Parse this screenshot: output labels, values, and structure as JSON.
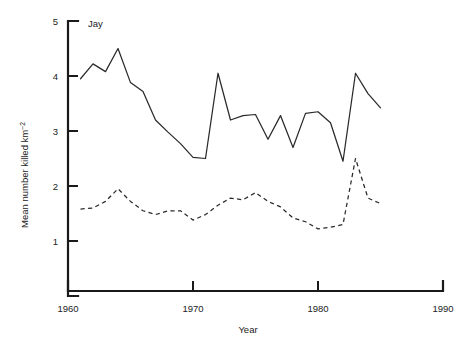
{
  "chart_data": {
    "type": "line",
    "title": "Jay",
    "xlabel": "Year",
    "ylabel": "Mean number killed km",
    "ylabel_exponent": "−2",
    "xlim": [
      1960,
      1990
    ],
    "ylim": [
      0,
      5
    ],
    "xticks": [
      1960,
      1970,
      1980,
      1990
    ],
    "xtick_labels": [
      "1960",
      "1970",
      "1980",
      "1990"
    ],
    "yticks": [
      1,
      2,
      3,
      4,
      5
    ],
    "ytick_labels": [
      "1",
      "2",
      "3",
      "4",
      "5"
    ],
    "grid": false,
    "legend_position": "none",
    "annotations": [
      {
        "text": "Jay",
        "x": 1961.2,
        "y": 4.85
      }
    ],
    "series": [
      {
        "name": "solid-series",
        "style": "solid",
        "x": [
          1961,
          1962,
          1963,
          1964,
          1965,
          1966,
          1967,
          1968,
          1969,
          1970,
          1971,
          1972,
          1973,
          1974,
          1975,
          1976,
          1977,
          1978,
          1979,
          1980,
          1981,
          1982,
          1983,
          1984,
          1985
        ],
        "values": [
          3.95,
          4.22,
          4.08,
          4.5,
          3.88,
          3.72,
          3.2,
          2.98,
          2.77,
          2.52,
          2.5,
          4.05,
          3.2,
          3.28,
          3.3,
          2.85,
          3.28,
          2.7,
          3.32,
          3.35,
          3.15,
          2.45,
          4.05,
          3.68,
          3.42
        ]
      },
      {
        "name": "dashed-series",
        "style": "dashed",
        "x": [
          1961,
          1962,
          1963,
          1964,
          1965,
          1966,
          1967,
          1968,
          1969,
          1970,
          1971,
          1972,
          1973,
          1974,
          1975,
          1976,
          1977,
          1978,
          1979,
          1980,
          1981,
          1982,
          1983,
          1984,
          1985
        ],
        "values": [
          1.58,
          1.6,
          1.72,
          1.95,
          1.72,
          1.55,
          1.48,
          1.55,
          1.55,
          1.38,
          1.48,
          1.65,
          1.78,
          1.75,
          1.88,
          1.72,
          1.62,
          1.42,
          1.35,
          1.22,
          1.25,
          1.3,
          2.5,
          1.78,
          1.68
        ]
      }
    ]
  },
  "geometry": {
    "x_axis_y": 291,
    "y_axis_x": 68,
    "x_1960": 68,
    "x_1990": 443,
    "y_value_5": 21,
    "y_value_0": 296,
    "px_per_year": 12.5,
    "px_per_unit": 55
  }
}
